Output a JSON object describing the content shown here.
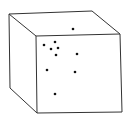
{
  "figure": {
    "title": "",
    "stroke_color": "#333333",
    "dot_color": "#111111",
    "background": "#ffffff"
  },
  "cube": {
    "vertices": {
      "back_top_left": [
        9,
        14
      ],
      "back_top_right": [
        92,
        11
      ],
      "front_top_left": [
        36,
        36
      ],
      "front_top_right": [
        120,
        34
      ],
      "front_bottom_left": [
        37,
        113
      ],
      "front_bottom_right": [
        122,
        112
      ],
      "back_bottom_left": [
        10,
        88
      ]
    }
  },
  "dots": [
    {
      "face": "top",
      "x": 73,
      "y": 29
    },
    {
      "face": "front",
      "x": 44,
      "y": 45
    },
    {
      "face": "front",
      "x": 55,
      "y": 42
    },
    {
      "face": "front",
      "x": 51,
      "y": 49
    },
    {
      "face": "front",
      "x": 58,
      "y": 48
    },
    {
      "face": "front",
      "x": 56,
      "y": 55
    },
    {
      "face": "front",
      "x": 77,
      "y": 54
    },
    {
      "face": "front",
      "x": 47,
      "y": 70
    },
    {
      "face": "front",
      "x": 75,
      "y": 72
    },
    {
      "face": "front",
      "x": 55,
      "y": 94
    }
  ]
}
